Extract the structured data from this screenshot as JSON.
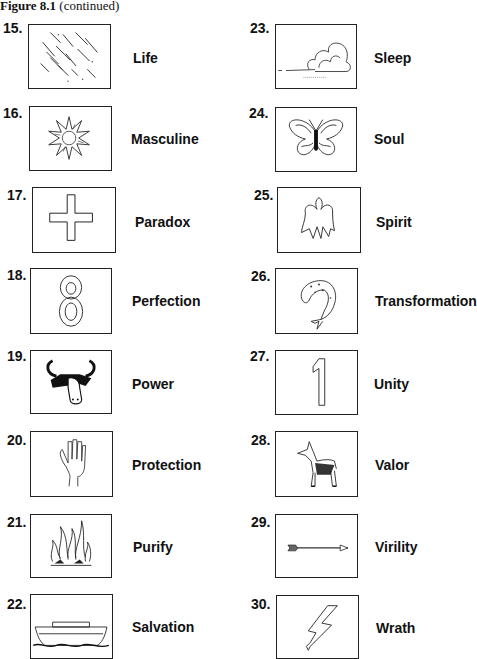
{
  "caption": {
    "figure": "Figure 8.1",
    "note": "(continued)"
  },
  "left_column": [
    {
      "number": "15.",
      "label": "Life",
      "icon": "rain-icon"
    },
    {
      "number": "16.",
      "label": "Masculine",
      "icon": "sun-icon"
    },
    {
      "number": "17.",
      "label": "Paradox",
      "icon": "cross-icon"
    },
    {
      "number": "18.",
      "label": "Perfection",
      "icon": "number-eight-icon"
    },
    {
      "number": "19.",
      "label": "Power",
      "icon": "bull-icon"
    },
    {
      "number": "20.",
      "label": "Protection",
      "icon": "hand-icon"
    },
    {
      "number": "21.",
      "label": "Purify",
      "icon": "fire-icon"
    },
    {
      "number": "22.",
      "label": "Salvation",
      "icon": "ark-icon"
    }
  ],
  "right_column": [
    {
      "number": "23.",
      "label": "Sleep",
      "icon": "cloud-icon"
    },
    {
      "number": "24.",
      "label": "Soul",
      "icon": "butterfly-icon"
    },
    {
      "number": "25.",
      "label": "Spirit",
      "icon": "angel-icon"
    },
    {
      "number": "26.",
      "label": "Transformation",
      "icon": "fish-icon"
    },
    {
      "number": "27.",
      "label": "Unity",
      "icon": "number-one-icon"
    },
    {
      "number": "28.",
      "label": "Valor",
      "icon": "dog-icon"
    },
    {
      "number": "29.",
      "label": "Virility",
      "icon": "arrow-icon"
    },
    {
      "number": "30.",
      "label": "Wrath",
      "icon": "lightning-icon"
    }
  ]
}
